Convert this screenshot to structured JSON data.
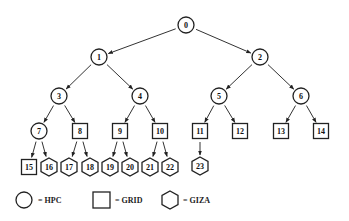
{
  "diagram": {
    "type": "tree",
    "colors": {
      "stroke": "#222222",
      "background": "#ffffff"
    },
    "nodes": [
      {
        "id": "0",
        "label": "0",
        "shape": "circle",
        "x": 186,
        "y": 25
      },
      {
        "id": "1",
        "label": "1",
        "shape": "circle",
        "x": 99,
        "y": 57
      },
      {
        "id": "2",
        "label": "2",
        "shape": "circle",
        "x": 260,
        "y": 57
      },
      {
        "id": "3",
        "label": "3",
        "shape": "circle",
        "x": 59,
        "y": 96
      },
      {
        "id": "4",
        "label": "4",
        "shape": "circle",
        "x": 140,
        "y": 96
      },
      {
        "id": "5",
        "label": "5",
        "shape": "circle",
        "x": 219,
        "y": 96
      },
      {
        "id": "6",
        "label": "6",
        "shape": "circle",
        "x": 301,
        "y": 96
      },
      {
        "id": "7",
        "label": "7",
        "shape": "circle",
        "x": 39,
        "y": 131
      },
      {
        "id": "8",
        "label": "8",
        "shape": "square",
        "x": 80,
        "y": 131
      },
      {
        "id": "9",
        "label": "9",
        "shape": "square",
        "x": 120,
        "y": 131
      },
      {
        "id": "10",
        "label": "10",
        "shape": "square",
        "x": 160,
        "y": 131
      },
      {
        "id": "11",
        "label": "11",
        "shape": "square",
        "x": 200,
        "y": 131
      },
      {
        "id": "12",
        "label": "12",
        "shape": "square",
        "x": 240,
        "y": 131
      },
      {
        "id": "13",
        "label": "13",
        "shape": "square",
        "x": 281,
        "y": 131
      },
      {
        "id": "14",
        "label": "14",
        "shape": "square",
        "x": 321,
        "y": 131
      },
      {
        "id": "15",
        "label": "15",
        "shape": "square",
        "x": 29,
        "y": 167
      },
      {
        "id": "16",
        "label": "16",
        "shape": "hexagon",
        "x": 49,
        "y": 167
      },
      {
        "id": "17",
        "label": "17",
        "shape": "hexagon",
        "x": 69,
        "y": 167
      },
      {
        "id": "18",
        "label": "18",
        "shape": "hexagon",
        "x": 90,
        "y": 167
      },
      {
        "id": "19",
        "label": "19",
        "shape": "hexagon",
        "x": 110,
        "y": 167
      },
      {
        "id": "20",
        "label": "20",
        "shape": "hexagon",
        "x": 130,
        "y": 167
      },
      {
        "id": "21",
        "label": "21",
        "shape": "hexagon",
        "x": 150,
        "y": 167
      },
      {
        "id": "22",
        "label": "22",
        "shape": "hexagon",
        "x": 170,
        "y": 167
      },
      {
        "id": "23",
        "label": "23",
        "shape": "hexagon",
        "x": 200,
        "y": 166
      }
    ],
    "edges": [
      [
        "0",
        "1"
      ],
      [
        "0",
        "2"
      ],
      [
        "1",
        "3"
      ],
      [
        "1",
        "4"
      ],
      [
        "2",
        "5"
      ],
      [
        "2",
        "6"
      ],
      [
        "3",
        "7"
      ],
      [
        "3",
        "8"
      ],
      [
        "4",
        "9"
      ],
      [
        "4",
        "10"
      ],
      [
        "5",
        "11"
      ],
      [
        "5",
        "12"
      ],
      [
        "6",
        "13"
      ],
      [
        "6",
        "14"
      ],
      [
        "7",
        "15"
      ],
      [
        "7",
        "16"
      ],
      [
        "8",
        "17"
      ],
      [
        "8",
        "18"
      ],
      [
        "9",
        "19"
      ],
      [
        "9",
        "20"
      ],
      [
        "10",
        "21"
      ],
      [
        "10",
        "22"
      ],
      [
        "11",
        "23"
      ]
    ]
  },
  "legend": {
    "items": [
      {
        "shape": "circle",
        "label": "= HPC"
      },
      {
        "shape": "square",
        "label": "= GRID"
      },
      {
        "shape": "hexagon",
        "label": "= GIZA"
      }
    ]
  }
}
